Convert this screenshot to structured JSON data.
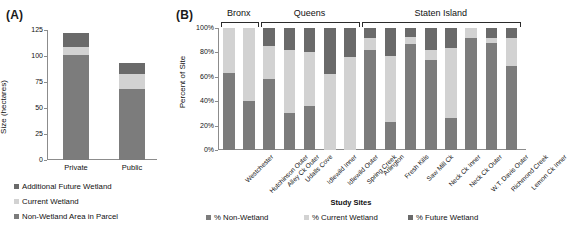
{
  "figure": {
    "panel_a_tag": "(A)",
    "panel_b_tag": "(B)"
  },
  "chart_data": [
    {
      "type": "bar",
      "id": "panel-a",
      "title": "",
      "stacked": true,
      "xlabel": "",
      "ylabel": "Size (hectares)",
      "ylim": [
        0,
        125
      ],
      "yticks": [
        0,
        25,
        50,
        75,
        100,
        125
      ],
      "ytick_labels": [
        "0",
        "25",
        "50",
        "75",
        "100",
        "125"
      ],
      "grid": false,
      "categories": [
        "Private",
        "Public"
      ],
      "series": [
        {
          "name": "Non-Wetland Area in Parcel",
          "color": "#7c7c7c",
          "values": [
            101,
            68
          ]
        },
        {
          "name": "Current Wetland",
          "color": "#d2d2d2",
          "values": [
            8,
            15
          ]
        },
        {
          "name": "Additional Future Wetland",
          "color": "#6a6a6a",
          "values": [
            13,
            10
          ]
        }
      ],
      "legend": [
        {
          "label": "Additional Future Wetland",
          "color": "#6a6a6a"
        },
        {
          "label": "Current Wetland",
          "color": "#d2d2d2"
        },
        {
          "label": "Non-Wetland Area in Parcel",
          "color": "#7c7c7c"
        }
      ],
      "legend_position": "below"
    },
    {
      "type": "bar",
      "id": "panel-b",
      "title": "",
      "stacked": true,
      "xlabel": "Study Sites",
      "ylabel": "Percent of Site",
      "ylim": [
        0,
        100
      ],
      "yticks": [
        0,
        20,
        40,
        60,
        80,
        100
      ],
      "ytick_labels": [
        "0%",
        "20%",
        "40%",
        "60%",
        "80%",
        "100%"
      ],
      "grid": false,
      "categories": [
        "Westchester",
        "Hutchinson Outer",
        "Alley Ck Outer",
        "Udalls Cove",
        "Idlewild Inner",
        "Idlewild Outer",
        "Spring Creek",
        "Arlington",
        "Fresh Kills",
        "Saw Mill Ck",
        "Neck Ck Inner",
        "Neck Ck Outer",
        "W.T. Davis Outer",
        "Richmond Creek",
        "Lemon Ck Inner"
      ],
      "groups": [
        {
          "label": "Bronx",
          "start": 0,
          "end": 1
        },
        {
          "label": "Queens",
          "start": 2,
          "end": 6
        },
        {
          "label": "Staten Island",
          "start": 7,
          "end": 14
        }
      ],
      "series": [
        {
          "name": "% Non-Wetland",
          "color": "#7c7c7c",
          "values": [
            63,
            40,
            58,
            30,
            36,
            0,
            0,
            82,
            23,
            87,
            74,
            26,
            92,
            88,
            69
          ]
        },
        {
          "name": "% Current Wetland",
          "color": "#d2d2d2",
          "values": [
            37,
            60,
            27,
            52,
            44,
            62,
            76,
            10,
            54,
            6,
            8,
            58,
            8,
            4,
            23
          ]
        },
        {
          "name": "% Future Wetland",
          "color": "#6a6a6a",
          "values": [
            0,
            0,
            15,
            18,
            20,
            38,
            24,
            8,
            23,
            7,
            18,
            16,
            0,
            8,
            8
          ]
        }
      ],
      "legend": [
        {
          "label": "% Non-Wetland",
          "color": "#7c7c7c"
        },
        {
          "label": "% Current Wetland",
          "color": "#d2d2d2"
        },
        {
          "label": "% Future Wetland",
          "color": "#6a6a6a"
        }
      ],
      "legend_position": "below"
    }
  ]
}
